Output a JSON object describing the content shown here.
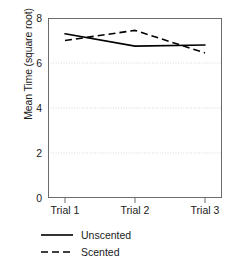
{
  "chart_data": {
    "type": "line",
    "title": "",
    "xlabel": "",
    "ylabel": "Mean Time (square root)",
    "categories": [
      "Trial 1",
      "Trial 2",
      "Trial 3"
    ],
    "series": [
      {
        "name": "Unscented",
        "style": "solid",
        "color": "#000000",
        "values": [
          7.3,
          6.75,
          6.8
        ]
      },
      {
        "name": "Scented",
        "style": "dashed",
        "color": "#000000",
        "values": [
          7.0,
          7.45,
          6.45
        ]
      }
    ],
    "ylim": [
      0,
      8
    ],
    "yticks": [
      0,
      2,
      4,
      6,
      8
    ],
    "ytick_labels": [
      "0",
      "2",
      "4",
      "6",
      "8"
    ],
    "gridlines": [
      2,
      4,
      6
    ],
    "grid": true,
    "grid_style": "dotted",
    "grid_color": "#d8d8d8",
    "axis_color": "#555555",
    "legend_position": "below-left"
  },
  "legend": {
    "entries": [
      {
        "label": "Unscented",
        "style": "solid"
      },
      {
        "label": "Scented",
        "style": "dashed"
      }
    ]
  },
  "axes": {
    "y_title": "Mean Time (square root)",
    "y_labels": [
      "8",
      "6",
      "4",
      "2",
      "0"
    ],
    "x_labels": [
      "Trial 1",
      "Trial 2",
      "Trial 3"
    ]
  }
}
